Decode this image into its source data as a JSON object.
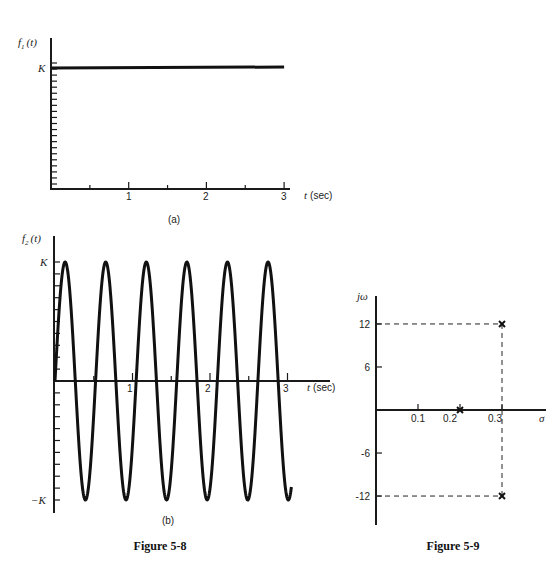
{
  "chart_data": [
    {
      "id": "fig5-8a",
      "type": "line",
      "panel_label": "(a)",
      "ylabel": "f1(t)",
      "xlabel": "t (sec)",
      "x_ticks": [
        1,
        2,
        3
      ],
      "x_minor_ticks": [
        0.5,
        1.5,
        2.5
      ],
      "y_tick_labels": [
        "K"
      ],
      "xlim": [
        0,
        3
      ],
      "ylim": [
        0,
        1.05
      ],
      "series": [
        {
          "name": "f1(t) = K (constant)",
          "x": [
            0,
            3
          ],
          "y": [
            1,
            1
          ]
        }
      ],
      "grid": false
    },
    {
      "id": "fig5-8b",
      "type": "line",
      "panel_label": "(b)",
      "ylabel": "f2(t)",
      "xlabel": "t (sec)",
      "x_ticks": [
        1,
        2,
        3
      ],
      "x_minor_ticks": [
        0.5,
        1.5,
        2.5
      ],
      "y_tick_labels": [
        "K",
        "-K"
      ],
      "xlim": [
        0,
        3.05
      ],
      "ylim": [
        -1,
        1
      ],
      "series": [
        {
          "name": "f2(t) = K sin(12t)",
          "function": "K*sin(12t)",
          "omega": 12,
          "amplitude": 1,
          "t_range": [
            0,
            3.05
          ]
        }
      ],
      "caption": "Figure 5-8",
      "grid": false
    },
    {
      "id": "fig5-9",
      "type": "scatter",
      "xlabel": "σ",
      "ylabel": "jω",
      "x_ticks": [
        0.1,
        0.2,
        0.3
      ],
      "y_ticks": [
        12,
        6,
        -6,
        -12
      ],
      "xlim": [
        0,
        0.4
      ],
      "ylim": [
        -16,
        16
      ],
      "series": [
        {
          "name": "poles",
          "marker": "x",
          "points": [
            [
              0.2,
              0
            ],
            [
              0.3,
              12
            ],
            [
              0.3,
              -12
            ]
          ]
        }
      ],
      "annotations": [
        "dashed guide lines from poles at (0.3, ±12) to axes"
      ],
      "caption": "Figure 5-9",
      "grid": false
    }
  ],
  "labels": {
    "a": {
      "ylabel_f": "f",
      "ylabel_sub": "1",
      "ylabel_arg": "(t)",
      "K": "K",
      "x1": "1",
      "x2": "2",
      "x3": "3",
      "xlabel_t": "t",
      "xlabel_unit": "(sec)",
      "panel": "(a)"
    },
    "b": {
      "ylabel_f": "f",
      "ylabel_sub": "2",
      "ylabel_arg": "(t)",
      "K": "K",
      "negK": "−K",
      "x1": "1",
      "x2": "2",
      "x3": "3",
      "xlabel_t": "t",
      "xlabel_unit": "(sec)",
      "panel": "(b)"
    },
    "fig58_caption": "Figure 5-8",
    "c": {
      "ylabel": "jω",
      "xlabel": "σ",
      "y12": "12",
      "y6": "6",
      "ym6": "-6",
      "ym12": "-12",
      "x01": "0.1",
      "x02": "0.2",
      "x03": "0.3"
    },
    "fig59_caption": "Figure 5-9"
  }
}
